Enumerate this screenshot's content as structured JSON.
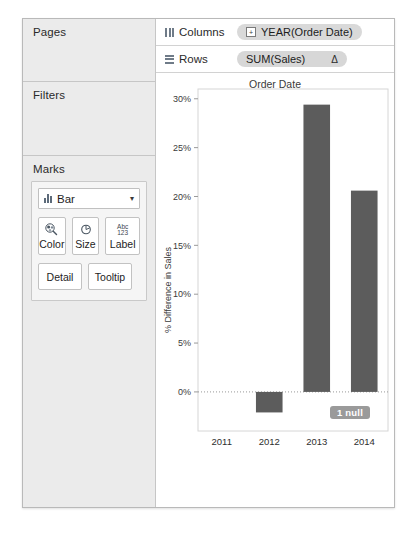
{
  "shelves": {
    "pages_label": "Pages",
    "filters_label": "Filters",
    "marks_label": "Marks",
    "columns_label": "Columns",
    "rows_label": "Rows",
    "columns_pill": "YEAR(Order Date)",
    "columns_pill_expander": "+",
    "rows_pill": "SUM(Sales)",
    "rows_pill_indicator": "Δ"
  },
  "marks": {
    "type_value": "Bar",
    "caret": "▾",
    "buttons": [
      {
        "label": "Color",
        "icon": "color-palette-icon"
      },
      {
        "label": "Size",
        "icon": "size-circle-icon"
      },
      {
        "label": "Label",
        "icon": "label-abc-icon"
      },
      {
        "label": "Detail",
        "icon": "detail-icon"
      },
      {
        "label": "Tooltip",
        "icon": "tooltip-icon"
      }
    ],
    "label_icon_top": "Abc",
    "label_icon_bottom": "123"
  },
  "chart_data": {
    "type": "bar",
    "title": "Order Date",
    "xlabel": "",
    "ylabel": "% Difference in Sales",
    "categories": [
      "2011",
      "2012",
      "2013",
      "2014"
    ],
    "values": [
      null,
      -2.1,
      29.4,
      20.6
    ],
    "ytick_labels": [
      "30%",
      "25%",
      "20%",
      "15%",
      "10%",
      "5%",
      "0%"
    ],
    "ytick_values": [
      30,
      25,
      20,
      15,
      10,
      5,
      0
    ],
    "ylim": [
      -4,
      31
    ],
    "grid": false,
    "zero_line": true,
    "bar_color": "#5c5c5c",
    "annotation": "1 null"
  }
}
